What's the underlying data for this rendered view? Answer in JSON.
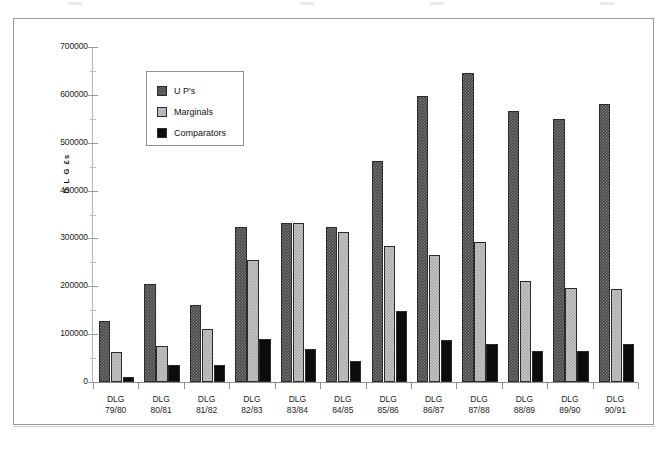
{
  "chart_data": {
    "type": "bar",
    "title": "",
    "xlabel": "",
    "ylabel": "D L G £s",
    "ylim": [
      0,
      700000
    ],
    "ytick_step": 100000,
    "yticks": [
      "0",
      "100000",
      "200000",
      "300000",
      "400000",
      "500000",
      "600000",
      "700000"
    ],
    "grid": false,
    "legend_position": "inside-top-left",
    "categories": [
      "DLG 79/80",
      "DLG 80/81",
      "DLG 81/82",
      "DLG 82/83",
      "DLG 83/84",
      "DLG 84/85",
      "DLG 85/86",
      "DLG 86/87",
      "DLG 87/88",
      "DLG 88/89",
      "DLG 89/90",
      "DLG 90/91"
    ],
    "category_lines": [
      [
        "DLG",
        "79/80"
      ],
      [
        "DLG",
        "80/81"
      ],
      [
        "DLG",
        "81/82"
      ],
      [
        "DLG",
        "82/83"
      ],
      [
        "DLG",
        "83/84"
      ],
      [
        "DLG",
        "84/85"
      ],
      [
        "DLG",
        "85/86"
      ],
      [
        "DLG",
        "86/87"
      ],
      [
        "DLG",
        "87/88"
      ],
      [
        "DLG",
        "88/89"
      ],
      [
        "DLG",
        "89/90"
      ],
      [
        "DLG",
        "90/91"
      ]
    ],
    "series": [
      {
        "name": "U P's",
        "color": "#4a4a4a",
        "values": [
          128000,
          204000,
          160000,
          324000,
          333000,
          324000,
          461000,
          597000,
          646000,
          567000,
          550000,
          580000
        ]
      },
      {
        "name": "Marginals",
        "color": "#c2c2c2",
        "values": [
          63000,
          76000,
          111000,
          255000,
          333000,
          314000,
          285000,
          266000,
          293000,
          211000,
          196000,
          195000
        ]
      },
      {
        "name": "Comparators",
        "color": "#0c0c0c",
        "values": [
          10000,
          35000,
          35000,
          90000,
          68000,
          43000,
          148000,
          88000,
          80000,
          65000,
          65000,
          80000
        ]
      }
    ]
  },
  "legend": {
    "items": [
      {
        "label": "U P's",
        "swatch": "#4a4a4a"
      },
      {
        "label": "Marginals",
        "swatch": "#c2c2c2"
      },
      {
        "label": "Comparators",
        "swatch": "#0c0c0c"
      }
    ]
  },
  "colors": {
    "frame": "#9a9a9a",
    "axis": "#8c8c8c",
    "series_up": "#4a4a4a",
    "series_marginals": "#c2c2c2",
    "series_comparators": "#0c0c0c",
    "background": "#ffffff"
  }
}
